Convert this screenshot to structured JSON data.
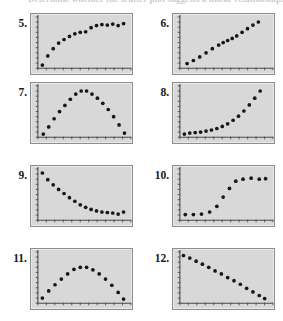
{
  "header": {
    "text": "Determine whether the scatter plot suggests a linear relationship."
  },
  "page": {
    "background_color": "#ffffff",
    "screen_background_color": "#d8d8d8",
    "screen_border_color": "#8d8d8d",
    "dot_color": "#17171a",
    "axis_color": "#4a4a4a"
  },
  "problems": [
    {
      "number": "5.",
      "name": "scatter-plot-5",
      "pattern": "logarithmic-increasing"
    },
    {
      "number": "6.",
      "name": "scatter-plot-6",
      "pattern": "linear-increasing"
    },
    {
      "number": "7.",
      "name": "scatter-plot-7",
      "pattern": "downward-parabola"
    },
    {
      "number": "8.",
      "name": "scatter-plot-8",
      "pattern": "exponential-increasing"
    },
    {
      "number": "9.",
      "name": "scatter-plot-9",
      "pattern": "exponential-decay"
    },
    {
      "number": "10.",
      "name": "scatter-plot-10",
      "pattern": "logistic-s-curve"
    },
    {
      "number": "11.",
      "name": "scatter-plot-11",
      "pattern": "downward-parabola-wide"
    },
    {
      "number": "12.",
      "name": "scatter-plot-12",
      "pattern": "linear-decreasing"
    }
  ],
  "chart_data": [
    {
      "type": "scatter",
      "title": "5.",
      "pattern": "logarithmic-increasing",
      "xlabel": "",
      "ylabel": "",
      "xlim": [
        0,
        100
      ],
      "ylim": [
        0,
        100
      ],
      "grid": false,
      "legend": "none",
      "x": [
        5,
        11,
        17,
        23,
        29,
        35,
        41,
        47,
        53,
        59,
        65,
        71,
        77,
        83,
        89,
        95
      ],
      "y": [
        6,
        24,
        38,
        49,
        56,
        62,
        67,
        70,
        71,
        79,
        83,
        85,
        84,
        86,
        83,
        87
      ]
    },
    {
      "type": "scatter",
      "title": "6.",
      "pattern": "linear-increasing",
      "xlabel": "",
      "ylabel": "",
      "xlim": [
        0,
        100
      ],
      "ylim": [
        0,
        100
      ],
      "grid": false,
      "legend": "none",
      "x": [
        8,
        15,
        22,
        29,
        36,
        43,
        48,
        53,
        58,
        63,
        69,
        75,
        81,
        87
      ],
      "y": [
        9,
        15,
        22,
        30,
        38,
        45,
        50,
        54,
        58,
        63,
        70,
        77,
        84,
        90
      ]
    },
    {
      "type": "scatter",
      "title": "7.",
      "pattern": "downward-parabola",
      "xlabel": "",
      "ylabel": "",
      "xlim": [
        0,
        100
      ],
      "ylim": [
        0,
        100
      ],
      "grid": false,
      "legend": "none",
      "x": [
        6,
        12,
        18,
        24,
        30,
        36,
        42,
        48,
        54,
        60,
        66,
        72,
        78,
        84,
        90,
        96
      ],
      "y": [
        6,
        20,
        36,
        50,
        62,
        74,
        84,
        90,
        90,
        84,
        76,
        66,
        54,
        40,
        24,
        8
      ]
    },
    {
      "type": "scatter",
      "title": "8.",
      "pattern": "exponential-increasing",
      "xlabel": "",
      "ylabel": "",
      "xlim": [
        0,
        100
      ],
      "ylim": [
        0,
        100
      ],
      "grid": false,
      "legend": "none",
      "x": [
        5,
        11,
        17,
        23,
        29,
        35,
        41,
        47,
        53,
        59,
        65,
        71,
        77,
        83,
        89
      ],
      "y": [
        6,
        8,
        9,
        10,
        12,
        14,
        17,
        21,
        26,
        33,
        41,
        51,
        63,
        76,
        90
      ]
    },
    {
      "type": "scatter",
      "title": "9.",
      "pattern": "exponential-decay",
      "xlabel": "",
      "ylabel": "",
      "xlim": [
        0,
        100
      ],
      "ylim": [
        0,
        100
      ],
      "grid": false,
      "legend": "none",
      "x": [
        5,
        11,
        17,
        23,
        29,
        35,
        41,
        47,
        53,
        59,
        65,
        71,
        77,
        83,
        89,
        95
      ],
      "y": [
        92,
        79,
        69,
        60,
        52,
        44,
        37,
        30,
        25,
        21,
        18,
        16,
        15,
        14,
        12,
        16
      ]
    },
    {
      "type": "scatter",
      "title": "10.",
      "pattern": "logistic-s-curve",
      "xlabel": "",
      "ylabel": "",
      "xlim": [
        0,
        100
      ],
      "ylim": [
        0,
        100
      ],
      "grid": false,
      "legend": "none",
      "x": [
        6,
        15,
        24,
        33,
        41,
        48,
        55,
        62,
        70,
        79,
        88,
        95
      ],
      "y": [
        11,
        11,
        12,
        16,
        27,
        45,
        62,
        76,
        80,
        82,
        80,
        81
      ]
    },
    {
      "type": "scatter",
      "title": "11.",
      "pattern": "downward-parabola-wide",
      "xlabel": "",
      "ylabel": "",
      "xlim": [
        0,
        100
      ],
      "ylim": [
        0,
        100
      ],
      "grid": false,
      "legend": "none",
      "x": [
        5,
        12,
        19,
        26,
        33,
        40,
        47,
        54,
        61,
        68,
        75,
        82,
        89,
        95
      ],
      "y": [
        10,
        24,
        36,
        47,
        57,
        66,
        70,
        70,
        65,
        57,
        47,
        35,
        21,
        8
      ]
    },
    {
      "type": "scatter",
      "title": "12.",
      "pattern": "linear-decreasing",
      "xlabel": "",
      "ylabel": "",
      "xlim": [
        0,
        100
      ],
      "ylim": [
        0,
        100
      ],
      "grid": false,
      "legend": "none",
      "x": [
        4,
        11,
        18,
        25,
        32,
        39,
        46,
        53,
        60,
        67,
        74,
        81,
        88,
        94
      ],
      "y": [
        93,
        88,
        82,
        76,
        70,
        63,
        57,
        50,
        44,
        37,
        29,
        22,
        15,
        9
      ]
    }
  ]
}
